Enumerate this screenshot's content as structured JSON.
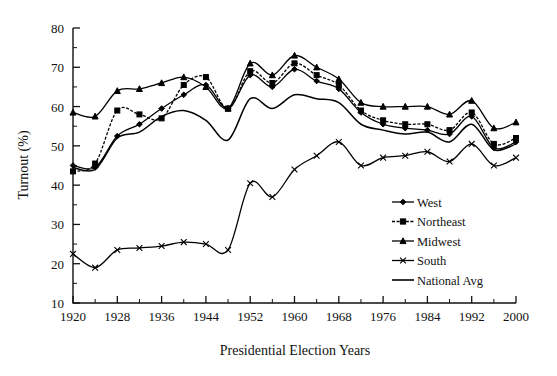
{
  "chart_data": {
    "type": "line",
    "title": "",
    "xlabel": "Presidential Election Years",
    "ylabel": "Turnout (%)",
    "xlim": [
      1920,
      2000
    ],
    "ylim": [
      10,
      80
    ],
    "xticks": [
      1920,
      1928,
      1936,
      1944,
      1952,
      1960,
      1968,
      1976,
      1984,
      1992,
      2000
    ],
    "xtick_labels": [
      "1920",
      "1928",
      "1936",
      "1944",
      "1952",
      "1960",
      "1968",
      "1976",
      "1984",
      "1992",
      "2000"
    ],
    "x_minor_step": 4,
    "yticks": [
      10,
      20,
      30,
      40,
      50,
      60,
      70,
      80
    ],
    "ytick_labels": [
      "10",
      "20",
      "30",
      "40",
      "50",
      "60",
      "70",
      "80"
    ],
    "y_minor_step": 5,
    "grid": false,
    "legend_position": "lower-right-inside",
    "x": [
      1920,
      1924,
      1928,
      1932,
      1936,
      1940,
      1944,
      1948,
      1952,
      1956,
      1960,
      1964,
      1968,
      1972,
      1976,
      1980,
      1984,
      1988,
      1992,
      1996,
      2000
    ],
    "series": [
      {
        "name": "West",
        "marker": "diamond",
        "dash": "solid",
        "color": "#000000",
        "values": [
          45.0,
          44.5,
          52.5,
          55.5,
          59.5,
          63.0,
          65.5,
          59.5,
          68.0,
          65.0,
          69.5,
          66.5,
          64.5,
          58.5,
          55.5,
          54.5,
          54.0,
          53.0,
          57.5,
          49.5,
          51.0
        ]
      },
      {
        "name": "Northeast",
        "marker": "square",
        "dash": "dashed",
        "color": "#000000",
        "values": [
          43.5,
          45.5,
          59.0,
          58.0,
          57.0,
          65.5,
          67.5,
          59.5,
          69.0,
          66.0,
          71.0,
          68.0,
          65.5,
          59.0,
          56.5,
          55.5,
          55.5,
          54.0,
          58.5,
          50.5,
          52.0
        ]
      },
      {
        "name": "Midwest",
        "marker": "triangle",
        "dash": "solid",
        "color": "#000000",
        "values": [
          58.5,
          57.5,
          64.0,
          64.5,
          66.0,
          67.5,
          65.0,
          59.5,
          71.0,
          68.0,
          73.0,
          70.0,
          67.0,
          61.0,
          60.0,
          60.0,
          60.0,
          58.0,
          61.5,
          54.5,
          56.0
        ]
      },
      {
        "name": "South",
        "marker": "cross",
        "dash": "solid",
        "color": "#000000",
        "values": [
          22.5,
          19.0,
          23.5,
          24.0,
          24.5,
          25.5,
          25.0,
          23.5,
          40.5,
          37.0,
          44.0,
          47.5,
          51.0,
          45.0,
          47.0,
          47.5,
          48.5,
          46.0,
          50.5,
          45.0,
          47.0
        ]
      },
      {
        "name": "National Avg",
        "marker": "none",
        "dash": "solid",
        "color": "#000000",
        "values": [
          44.5,
          44.0,
          52.0,
          53.5,
          57.5,
          59.0,
          56.5,
          51.5,
          62.0,
          59.5,
          63.0,
          62.0,
          61.0,
          55.5,
          54.0,
          53.0,
          53.5,
          51.0,
          55.5,
          49.0,
          50.5
        ]
      }
    ],
    "legend_entries": [
      "West",
      "Northeast",
      "Midwest",
      "South",
      "National Avg"
    ]
  }
}
